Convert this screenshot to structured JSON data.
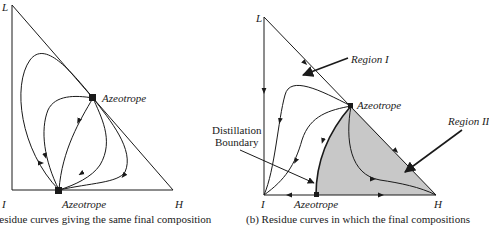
{
  "panel_a": {
    "vertex_L": "L",
    "vertex_I": "I",
    "vertex_H": "H",
    "azeotrope_top": "Azeotrope",
    "azeotrope_bottom": "Azeotrope",
    "caption": "Residue curves giving the same final composition"
  },
  "panel_b": {
    "vertex_L": "L",
    "vertex_I": "I",
    "vertex_H": "H",
    "azeotrope_top": "Azeotrope",
    "azeotrope_bottom": "Azeotrope",
    "region_1": "Region I",
    "region_2": "Region II",
    "boundary_line1": "Distillation",
    "boundary_line2": "Boundary",
    "caption": "(b) Residue curves in which the final compositions"
  },
  "colors": {
    "line": "#1a1a1a",
    "region_ii_fill": "#c8c8c8"
  }
}
